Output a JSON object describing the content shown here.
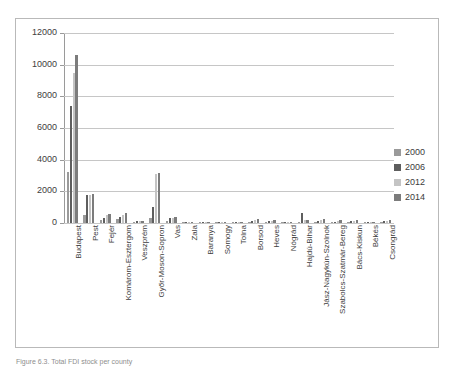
{
  "figure": {
    "caption": "Figure 6.3. Total FDI stock per county"
  },
  "chart_data": {
    "type": "bar",
    "title": "",
    "xlabel": "",
    "ylabel": "",
    "ylim": [
      0,
      12000
    ],
    "yticks": [
      0,
      2000,
      4000,
      6000,
      8000,
      10000,
      12000
    ],
    "ytick_labels": [
      "0",
      "2000",
      "4000",
      "6000",
      "8000",
      "10000",
      "12000"
    ],
    "grid": true,
    "legend_position": "right",
    "categories": [
      "Budapest",
      "Pest",
      "Fejér",
      "Komárom-Esztergom",
      "Veszprém",
      "Győr-Moson-Sopron",
      "Vas",
      "Zala",
      "Baranya",
      "Somogy",
      "Tolna",
      "Borsod",
      "Heves",
      "Nógrád",
      "Hajdú-Bihar",
      "Jász-Nagykún-Szolnok",
      "Szabolcs-Szatmár-Bereg",
      "Bács-Kiskun",
      "Békés",
      "Csongrád"
    ],
    "series": [
      {
        "name": "2000",
        "color": "#9a9a9a",
        "values": [
          3200,
          500,
          180,
          250,
          60,
          300,
          120,
          30,
          40,
          25,
          15,
          90,
          60,
          20,
          70,
          60,
          35,
          55,
          20,
          60
        ]
      },
      {
        "name": "2006",
        "color": "#5e5e5e",
        "values": [
          7400,
          1750,
          320,
          400,
          110,
          1020,
          290,
          55,
          75,
          60,
          25,
          150,
          110,
          35,
          640,
          120,
          70,
          110,
          35,
          110
        ]
      },
      {
        "name": "2012",
        "color": "#c4c4c4",
        "values": [
          9500,
          1790,
          480,
          520,
          120,
          3080,
          330,
          70,
          85,
          70,
          30,
          200,
          130,
          40,
          170,
          200,
          110,
          150,
          45,
          140
        ]
      },
      {
        "name": "2014",
        "color": "#7c7c7c",
        "values": [
          10600,
          1840,
          600,
          660,
          130,
          3180,
          400,
          80,
          95,
          80,
          35,
          230,
          180,
          45,
          180,
          240,
          200,
          160,
          50,
          170
        ]
      }
    ]
  },
  "legend": {
    "items": [
      {
        "label": "2000",
        "color": "#9a9a9a"
      },
      {
        "label": "2006",
        "color": "#5e5e5e"
      },
      {
        "label": "2012",
        "color": "#c4c4c4"
      },
      {
        "label": "2014",
        "color": "#7c7c7c"
      }
    ]
  }
}
